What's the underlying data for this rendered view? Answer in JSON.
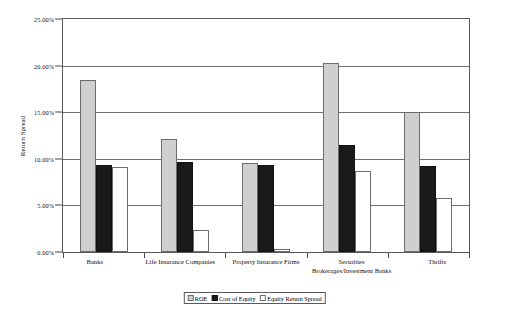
{
  "chart_data": {
    "type": "bar",
    "title": "",
    "xlabel": "",
    "ylabel": "Return Spread",
    "ylim": [
      0,
      25
    ],
    "ytick_labels": [
      "0.00%",
      "5.00%",
      "10.00%",
      "15.00%",
      "20.00%",
      "25.00%"
    ],
    "ytick_values": [
      0,
      5,
      10,
      15,
      20,
      25
    ],
    "grid": true,
    "legend_position": "bottom",
    "categories": [
      "Banks",
      "Life Insurance Companies",
      "Property Insurance Firms",
      "Securities Brokerages/Investment Banks",
      "Thrifts"
    ],
    "series": [
      {
        "name": "ROE",
        "color": "#cfcfcf",
        "values": [
          18.5,
          12.1,
          9.5,
          20.3,
          15.0
        ]
      },
      {
        "name": "Cost of Equity",
        "color": "#1a1a1a",
        "values": [
          9.3,
          9.7,
          9.3,
          11.5,
          9.2
        ]
      },
      {
        "name": "Equity Return Spread",
        "color": "#ffffff",
        "values": [
          9.1,
          2.4,
          0.3,
          8.7,
          5.8
        ]
      }
    ]
  },
  "axis": {
    "y_label": "Return Spread"
  },
  "legend": {
    "items": [
      {
        "label": "ROE",
        "swatch": "roe"
      },
      {
        "label": "Cost of Equity",
        "swatch": "coe"
      },
      {
        "label": "Equity Return Spread",
        "swatch": "spread"
      }
    ]
  },
  "caption": "    "
}
